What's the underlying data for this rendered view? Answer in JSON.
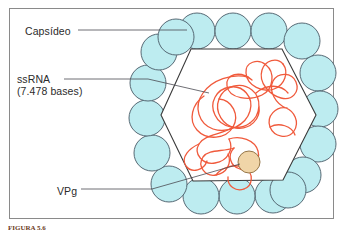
{
  "figure": {
    "type": "biological-diagram",
    "labels": {
      "capsid": "Capsídeo",
      "ssrna_name": "ssRNA",
      "ssrna_detail": "(7.478 bases)",
      "vpg": "VPg"
    },
    "caption": "FIGURA 5.6",
    "colors": {
      "capsomere_fill": "#bdecf0",
      "capsomere_stroke": "#4a5a66",
      "rna_stroke": "#f05a3c",
      "vpg_fill": "#f0d5a8",
      "vpg_stroke": "#8a6a3a",
      "hexagon_stroke": "#3a3a3a",
      "leader_line": "#4a4a52",
      "frame_border": "#8a8a8a",
      "background": "#ffffff",
      "text": "#2b2b2b"
    },
    "structure": {
      "capsomere_count": 18,
      "capsomere_radius": 18,
      "hexagon_sides": 6,
      "vpg_radius": 11
    },
    "leaders": {
      "capsid_label_to_capsomere": "horizontal line from Capsídeo label to upper-left capsomere",
      "ssrna_label_to_strand": "horizontal then angled line from ssRNA label into the RNA coil",
      "vpg_label_to_protein": "horizontal then angled line from VPg label up to the tan VPg sphere"
    }
  }
}
